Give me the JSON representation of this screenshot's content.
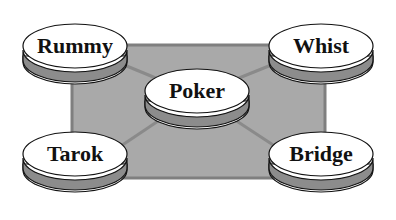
{
  "diagram": {
    "type": "hub-and-spoke network",
    "colors": {
      "background": "#ffffff",
      "table_fill": "#a9a9a9",
      "table_border": "#7f7f7f",
      "connector": "#8a8a8a",
      "disc_top": "#ffffff",
      "disc_band": "#8c8c8c",
      "disc_outline": "#111111"
    },
    "hub": {
      "label": "Poker"
    },
    "nodes": [
      {
        "id": "rummy",
        "label": "Rummy",
        "position": "top-left"
      },
      {
        "id": "whist",
        "label": "Whist",
        "position": "top-right"
      },
      {
        "id": "tarok",
        "label": "Tarok",
        "position": "bottom-left"
      },
      {
        "id": "bridge",
        "label": "Bridge",
        "position": "bottom-right"
      }
    ],
    "edges": [
      {
        "from": "Poker",
        "to": "Rummy"
      },
      {
        "from": "Poker",
        "to": "Whist"
      },
      {
        "from": "Poker",
        "to": "Tarok"
      },
      {
        "from": "Poker",
        "to": "Bridge"
      }
    ]
  }
}
